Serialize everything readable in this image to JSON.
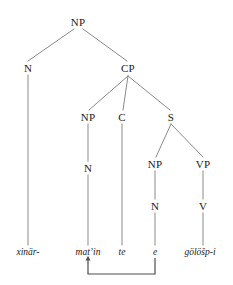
{
  "figure": {
    "type": "syntax-tree",
    "line_color": "#8a8a8a",
    "text_color": "#1a1a1a",
    "background": "#ffffff"
  },
  "nodes": [
    {
      "id": "NP-root",
      "label": "NP",
      "x": 78,
      "y": 22
    },
    {
      "id": "N-1",
      "label": "N",
      "x": 28,
      "y": 68
    },
    {
      "id": "CP",
      "label": "CP",
      "x": 128,
      "y": 68
    },
    {
      "id": "NP-2",
      "label": "NP",
      "x": 88,
      "y": 117
    },
    {
      "id": "C",
      "label": "C",
      "x": 122,
      "y": 117
    },
    {
      "id": "S",
      "label": "S",
      "x": 171,
      "y": 117
    },
    {
      "id": "N-2",
      "label": "N",
      "x": 88,
      "y": 168
    },
    {
      "id": "NP-3",
      "label": "NP",
      "x": 155,
      "y": 164
    },
    {
      "id": "VP",
      "label": "VP",
      "x": 203,
      "y": 164
    },
    {
      "id": "N-3",
      "label": "N",
      "x": 155,
      "y": 206
    },
    {
      "id": "V",
      "label": "V",
      "x": 203,
      "y": 206
    }
  ],
  "terminals": [
    {
      "id": "t-xinar",
      "label": "xinär-",
      "x": 28,
      "y": 252
    },
    {
      "id": "t-matin",
      "label": "mat’in",
      "x": 88,
      "y": 252
    },
    {
      "id": "t-te",
      "label": "te",
      "x": 122,
      "y": 252
    },
    {
      "id": "t-e",
      "label": "e",
      "x": 155,
      "y": 252
    },
    {
      "id": "t-golosp",
      "label": "gölöšp-i",
      "x": 200,
      "y": 252
    }
  ],
  "edges": [
    {
      "id": "edge-np-n",
      "from": "NP-root",
      "to": "N-1",
      "x1": 74,
      "y1": 29,
      "x2": 28,
      "y2": 61
    },
    {
      "id": "edge-np-cp",
      "from": "NP-root",
      "to": "CP",
      "x1": 83,
      "y1": 29,
      "x2": 127,
      "y2": 61
    },
    {
      "id": "edge-cp-np",
      "from": "CP",
      "to": "NP-2",
      "x1": 128,
      "y1": 76,
      "x2": 89,
      "y2": 110
    },
    {
      "id": "edge-cp-c",
      "from": "CP",
      "to": "C",
      "x1": 128,
      "y1": 76,
      "x2": 123,
      "y2": 110
    },
    {
      "id": "edge-cp-s",
      "from": "CP",
      "to": "S",
      "x1": 128,
      "y1": 76,
      "x2": 170,
      "y2": 110
    },
    {
      "id": "edge-s-np",
      "from": "S",
      "to": "NP-3",
      "x1": 171,
      "y1": 124,
      "x2": 156,
      "y2": 157
    },
    {
      "id": "edge-s-vp",
      "from": "S",
      "to": "VP",
      "x1": 171,
      "y1": 124,
      "x2": 203,
      "y2": 157
    },
    {
      "id": "edge-np2-n2",
      "from": "NP-2",
      "to": "N-2",
      "x1": 88,
      "y1": 124,
      "x2": 88,
      "y2": 161
    },
    {
      "id": "edge-np3-n3",
      "from": "NP-3",
      "to": "N-3",
      "x1": 155,
      "y1": 171,
      "x2": 155,
      "y2": 199
    },
    {
      "id": "edge-vp-v",
      "from": "VP",
      "to": "V",
      "x1": 203,
      "y1": 171,
      "x2": 203,
      "y2": 199
    },
    {
      "id": "edge-n1-term",
      "from": "N-1",
      "to": "t-xinar",
      "x1": 28,
      "y1": 75,
      "x2": 28,
      "y2": 245
    },
    {
      "id": "edge-n2-term",
      "from": "N-2",
      "to": "t-matin",
      "x1": 88,
      "y1": 175,
      "x2": 88,
      "y2": 245
    },
    {
      "id": "edge-c-term",
      "from": "C",
      "to": "t-te",
      "x1": 122,
      "y1": 124,
      "x2": 122,
      "y2": 245
    },
    {
      "id": "edge-n3-term",
      "from": "N-3",
      "to": "t-e",
      "x1": 155,
      "y1": 213,
      "x2": 155,
      "y2": 245
    },
    {
      "id": "edge-v-term",
      "from": "V",
      "to": "t-golosp",
      "x1": 203,
      "y1": 213,
      "x2": 203,
      "y2": 245
    }
  ],
  "movement_arrow": {
    "id": "movement-arrow",
    "from_terminal": "t-e",
    "to_terminal": "t-matin",
    "start_x": 155,
    "start_y": 258,
    "bottom_y": 274,
    "end_x": 88,
    "end_y": 259,
    "arrowhead": "up"
  }
}
